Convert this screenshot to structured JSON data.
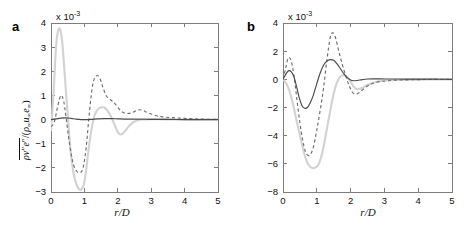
{
  "figure": {
    "panels": [
      {
        "id": "a",
        "label": "a",
        "exponent_label": "x 10",
        "exponent_value": "-3",
        "xlabel": "r/D",
        "ylabel_text": "ρv''e''/(ρ∞u∞e∞)",
        "xticks": [
          "0",
          "1",
          "2",
          "3",
          "4",
          "5"
        ],
        "yticks": [
          "4",
          "3",
          "2",
          "1",
          "0",
          "-1",
          "-2",
          "-3"
        ]
      },
      {
        "id": "b",
        "label": "b",
        "exponent_label": "x 10",
        "exponent_value": "-3",
        "xlabel": "r/D",
        "ylabel_text": "ρur''e''/(ρ∞u∞e∞)",
        "xticks": [
          "0",
          "1",
          "2",
          "3",
          "4",
          "5"
        ],
        "yticks": [
          "4",
          "2",
          "0",
          "-2",
          "-4",
          "-6",
          "-8"
        ]
      }
    ]
  },
  "chart_data": [
    {
      "type": "line",
      "panel": "a",
      "title": "",
      "xlabel": "r/D",
      "ylabel": "ρv''e''/(ρ∞u∞e∞)",
      "y_scale": "1e-3",
      "xlim": [
        0,
        5
      ],
      "ylim": [
        -3,
        4
      ],
      "xticks": [
        0,
        1,
        2,
        3,
        4,
        5
      ],
      "yticks": [
        -3,
        -2,
        -1,
        0,
        1,
        2,
        3,
        4
      ],
      "grid": false,
      "legend": "none",
      "series": [
        {
          "name": "solid-dark",
          "style": "solid",
          "color": "#4a4a4a",
          "x": [
            0,
            0.15,
            0.3,
            0.45,
            0.6,
            0.75,
            0.9,
            1.05,
            1.2,
            1.4,
            1.6,
            1.8,
            2.0,
            2.2,
            2.5,
            3.0,
            3.5,
            4.0,
            4.5,
            5.0
          ],
          "y": [
            0.0,
            0.03,
            0.06,
            0.07,
            0.05,
            0.02,
            0.0,
            0.0,
            0.01,
            0.03,
            0.04,
            0.04,
            0.03,
            0.02,
            0.02,
            0.01,
            0.01,
            0.0,
            0.0,
            0.0
          ]
        },
        {
          "name": "dashed-gray",
          "style": "dashed",
          "color": "#6e6e6e",
          "x": [
            0,
            0.1,
            0.2,
            0.3,
            0.38,
            0.45,
            0.55,
            0.65,
            0.75,
            0.85,
            0.95,
            1.05,
            1.15,
            1.25,
            1.35,
            1.45,
            1.55,
            1.65,
            1.75,
            1.85,
            1.95,
            2.05,
            2.15,
            2.3,
            2.45,
            2.6,
            2.75,
            2.9,
            3.1,
            3.3,
            3.6,
            4.0,
            4.5,
            5.0
          ],
          "y": [
            -0.3,
            -0.1,
            0.55,
            1.0,
            0.75,
            0.1,
            -0.95,
            -1.75,
            -2.1,
            -2.2,
            -2.05,
            -1.2,
            0.3,
            1.45,
            1.8,
            1.75,
            1.35,
            1.0,
            0.85,
            0.75,
            0.6,
            0.42,
            0.3,
            0.25,
            0.3,
            0.4,
            0.38,
            0.28,
            0.18,
            0.12,
            0.08,
            0.05,
            0.02,
            0.01
          ]
        },
        {
          "name": "light-gray",
          "style": "solid-light",
          "color": "#d2d2d2",
          "x": [
            0,
            0.08,
            0.15,
            0.2,
            0.25,
            0.3,
            0.35,
            0.42,
            0.5,
            0.58,
            0.66,
            0.74,
            0.82,
            0.9,
            0.98,
            1.05,
            1.12,
            1.2,
            1.3,
            1.4,
            1.5,
            1.6,
            1.7,
            1.8,
            1.9,
            2.0,
            2.1,
            2.2,
            2.35,
            2.5,
            2.7,
            3.0,
            3.4,
            4.0,
            4.5,
            5.0
          ],
          "y": [
            -0.45,
            1.2,
            3.0,
            3.6,
            3.78,
            3.6,
            3.0,
            1.7,
            0.2,
            -1.2,
            -2.1,
            -2.6,
            -2.85,
            -2.9,
            -2.7,
            -2.1,
            -1.3,
            -0.5,
            0.15,
            0.42,
            0.5,
            0.5,
            0.35,
            0.12,
            -0.2,
            -0.52,
            -0.62,
            -0.5,
            -0.25,
            -0.08,
            0.0,
            0.02,
            0.01,
            0.0,
            0.0,
            0.0
          ]
        }
      ]
    },
    {
      "type": "line",
      "panel": "b",
      "title": "",
      "xlabel": "r/D",
      "ylabel": "ρur''e''/(ρ∞u∞e∞)",
      "y_scale": "1e-3",
      "xlim": [
        0,
        5
      ],
      "ylim": [
        -8,
        4
      ],
      "xticks": [
        0,
        1,
        2,
        3,
        4,
        5
      ],
      "yticks": [
        -8,
        -6,
        -4,
        -2,
        0,
        2,
        4
      ],
      "grid": false,
      "legend": "none",
      "series": [
        {
          "name": "solid-dark",
          "style": "solid",
          "color": "#4a4a4a",
          "x": [
            0,
            0.08,
            0.16,
            0.24,
            0.32,
            0.4,
            0.48,
            0.56,
            0.64,
            0.72,
            0.8,
            0.9,
            1.0,
            1.1,
            1.2,
            1.3,
            1.4,
            1.5,
            1.6,
            1.7,
            1.8,
            1.9,
            2.0,
            2.1,
            2.2,
            2.35,
            2.5,
            2.7,
            2.9,
            3.2,
            3.6,
            4.0,
            4.5,
            5.0
          ],
          "y": [
            0.0,
            0.35,
            0.6,
            0.55,
            0.2,
            -0.5,
            -1.3,
            -1.85,
            -2.05,
            -2.0,
            -1.7,
            -1.1,
            -0.3,
            0.45,
            1.0,
            1.3,
            1.4,
            1.35,
            1.1,
            0.75,
            0.4,
            0.12,
            -0.05,
            -0.1,
            -0.08,
            -0.02,
            0.02,
            0.03,
            0.03,
            0.02,
            0.02,
            0.01,
            0.01,
            0.0
          ]
        },
        {
          "name": "dashed-gray",
          "style": "dashed",
          "color": "#6e6e6e",
          "x": [
            0,
            0.08,
            0.15,
            0.22,
            0.28,
            0.35,
            0.42,
            0.5,
            0.58,
            0.66,
            0.74,
            0.82,
            0.9,
            1.0,
            1.1,
            1.2,
            1.3,
            1.4,
            1.48,
            1.56,
            1.65,
            1.75,
            1.85,
            1.95,
            2.05,
            2.15,
            2.25,
            2.4,
            2.55,
            2.7,
            2.9,
            3.1,
            3.4,
            3.8,
            4.3,
            5.0
          ],
          "y": [
            0.0,
            0.8,
            1.5,
            1.45,
            0.9,
            -0.2,
            -1.6,
            -3.1,
            -4.3,
            -5.1,
            -5.4,
            -5.3,
            -4.8,
            -3.6,
            -2.2,
            -0.6,
            1.4,
            3.0,
            3.3,
            2.9,
            2.0,
            1.1,
            0.3,
            -0.4,
            -0.9,
            -1.05,
            -0.95,
            -0.65,
            -0.4,
            -0.25,
            -0.15,
            -0.1,
            -0.05,
            -0.03,
            -0.01,
            0.0
          ]
        },
        {
          "name": "light-gray",
          "style": "solid-light",
          "color": "#d2d2d2",
          "x": [
            0,
            0.1,
            0.2,
            0.3,
            0.4,
            0.5,
            0.6,
            0.7,
            0.8,
            0.88,
            0.96,
            1.04,
            1.12,
            1.2,
            1.3,
            1.4,
            1.5,
            1.6,
            1.7,
            1.8,
            1.9,
            2.0,
            2.1,
            2.2,
            2.35,
            2.5,
            2.7,
            2.9,
            3.2,
            3.6,
            4.0,
            4.5,
            5.0
          ],
          "y": [
            0.0,
            -0.3,
            -0.9,
            -1.8,
            -2.9,
            -4.0,
            -5.0,
            -5.8,
            -6.2,
            -6.3,
            -6.25,
            -6.1,
            -5.6,
            -4.8,
            -3.5,
            -2.2,
            -1.0,
            -0.2,
            0.2,
            0.3,
            0.15,
            -0.15,
            -0.55,
            -0.7,
            -0.6,
            -0.4,
            -0.22,
            -0.12,
            -0.06,
            -0.03,
            -0.02,
            -0.01,
            0.0
          ]
        }
      ]
    }
  ]
}
